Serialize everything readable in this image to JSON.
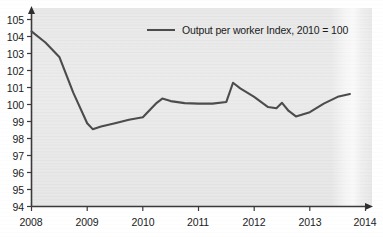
{
  "chart": {
    "type": "line",
    "title": "",
    "legend_position": "top-center",
    "legend_label": "Output per worker Index, 2010 = 100",
    "line_color": "#4c4c4c",
    "plot_background": "#eaeaea",
    "axis_color": "#3a3a3a"
  },
  "axes": {
    "x": {
      "label": "",
      "ticks": [
        "2008",
        "2009",
        "2010",
        "2011",
        "2012",
        "2013",
        "2014"
      ],
      "min": 2008,
      "max": 2014,
      "has_arrow": true
    },
    "y": {
      "label": "",
      "ticks": [
        "94",
        "95",
        "96",
        "97",
        "98",
        "99",
        "100",
        "101",
        "102",
        "103",
        "104",
        "105"
      ],
      "min": 94,
      "max": 105,
      "has_arrow": true
    }
  },
  "chart_data": {
    "type": "line",
    "title": "",
    "xlabel": "",
    "ylabel": "",
    "xlim": [
      2008,
      2014
    ],
    "ylim": [
      94,
      105
    ],
    "grid": false,
    "legend_position": "top-center",
    "xtick_labels": [
      "2008",
      "2009",
      "2010",
      "2011",
      "2012",
      "2013",
      "2014"
    ],
    "ytick_labels": [
      "94",
      "95",
      "96",
      "97",
      "98",
      "99",
      "100",
      "101",
      "102",
      "103",
      "104",
      "105"
    ],
    "series": [
      {
        "name": "Output per worker Index, 2010 = 100",
        "color": "#4c4c4c",
        "x": [
          2008.0,
          2008.25,
          2008.5,
          2008.75,
          2009.0,
          2009.1,
          2009.25,
          2009.5,
          2009.75,
          2010.0,
          2010.25,
          2010.35,
          2010.5,
          2010.75,
          2011.0,
          2011.25,
          2011.5,
          2011.62,
          2011.75,
          2012.0,
          2012.25,
          2012.4,
          2012.5,
          2012.62,
          2012.75,
          2013.0,
          2013.25,
          2013.5,
          2013.72
        ],
        "y": [
          104.3,
          103.65,
          102.8,
          100.7,
          98.9,
          98.55,
          98.7,
          98.9,
          99.1,
          99.25,
          100.1,
          100.35,
          100.2,
          100.08,
          100.05,
          100.05,
          100.15,
          101.28,
          100.95,
          100.45,
          99.85,
          99.78,
          100.1,
          99.62,
          99.3,
          99.55,
          100.05,
          100.45,
          100.62
        ]
      }
    ]
  }
}
